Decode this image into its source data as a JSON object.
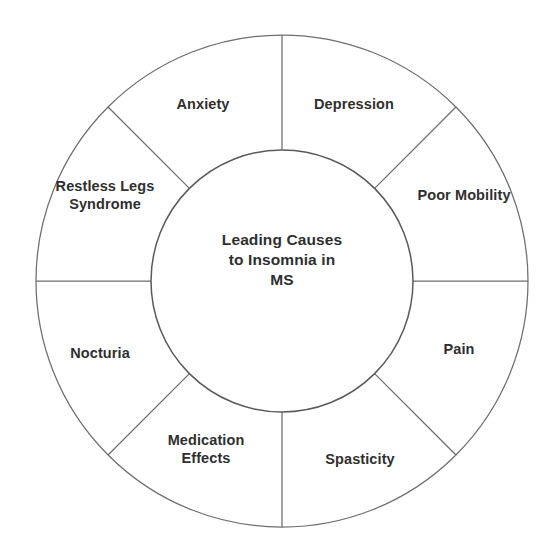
{
  "diagram": {
    "type": "donut-wheel",
    "hub": {
      "name": "hub",
      "lines": [
        "Leading Causes",
        "to Insomnia in",
        "MS"
      ]
    },
    "geometry": {
      "center_x": 282,
      "center_y": 281,
      "outer_radius": 246,
      "inner_radius": 131,
      "segment_count": 8,
      "spoke_angles_deg": [
        0,
        45,
        90,
        135,
        180,
        225,
        270,
        315
      ]
    },
    "colors": {
      "background": "#ffffff",
      "stroke": "#6e6e6e",
      "hub_stroke": "#5a5a5a",
      "text": "#2f2f2f"
    },
    "segments": [
      {
        "id": "depression",
        "lines": [
          "Depression"
        ],
        "label_x": 354,
        "label_y": 105,
        "start_deg": 45,
        "end_deg": 90
      },
      {
        "id": "poor-mobility",
        "lines": [
          "Poor Mobility"
        ],
        "label_x": 464,
        "label_y": 196,
        "start_deg": 0,
        "end_deg": 45
      },
      {
        "id": "pain",
        "lines": [
          "Pain"
        ],
        "label_x": 459,
        "label_y": 350,
        "start_deg": 315,
        "end_deg": 360
      },
      {
        "id": "spasticity",
        "lines": [
          "Spasticity"
        ],
        "label_x": 360,
        "label_y": 460,
        "start_deg": 270,
        "end_deg": 315
      },
      {
        "id": "medication-effects",
        "lines": [
          "Medication",
          "Effects"
        ],
        "label_x": 206,
        "label_y": 450,
        "start_deg": 225,
        "end_deg": 270
      },
      {
        "id": "nocturia",
        "lines": [
          "Nocturia"
        ],
        "label_x": 100,
        "label_y": 354,
        "start_deg": 180,
        "end_deg": 225
      },
      {
        "id": "restless-legs-syndrome",
        "lines": [
          "Restless Legs",
          "Syndrome"
        ],
        "label_x": 105,
        "label_y": 196,
        "start_deg": 135,
        "end_deg": 180
      },
      {
        "id": "anxiety",
        "lines": [
          "Anxiety"
        ],
        "label_x": 203,
        "label_y": 105,
        "start_deg": 90,
        "end_deg": 135
      }
    ]
  }
}
